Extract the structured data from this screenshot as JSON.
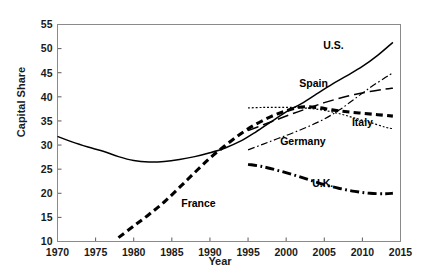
{
  "chart_data": {
    "type": "line",
    "title": "",
    "xlabel": "Year",
    "ylabel": "Capital Share",
    "xlim": [
      1970,
      2015
    ],
    "ylim": [
      10,
      55
    ],
    "xticks": [
      1970,
      1975,
      1980,
      1985,
      1990,
      1995,
      2000,
      2005,
      2010,
      2015
    ],
    "yticks": [
      10,
      15,
      20,
      25,
      30,
      35,
      40,
      45,
      50,
      55
    ],
    "grid": false,
    "legend": "inline-annotations",
    "series": [
      {
        "name": "U.S.",
        "style": "solid",
        "label_x": 2006.2,
        "label_y": 50.0,
        "x": [
          1970,
          1972,
          1974,
          1976,
          1978,
          1980,
          1982,
          1984,
          1986,
          1988,
          1990,
          1992,
          1994,
          1996,
          1998,
          2000,
          2002,
          2004,
          2006,
          2008,
          2010,
          2012,
          2014
        ],
        "y": [
          31.8,
          30.6,
          29.6,
          28.7,
          27.6,
          26.8,
          26.5,
          26.6,
          27.0,
          27.6,
          28.4,
          29.4,
          30.8,
          32.7,
          34.8,
          36.9,
          38.6,
          40.6,
          42.6,
          44.4,
          46.3,
          48.6,
          51.3
        ]
      },
      {
        "name": "France",
        "style": "bold-dashed",
        "label_x": 1988.5,
        "label_y": 17.2,
        "x": [
          1978,
          1980,
          1982,
          1984,
          1986,
          1988,
          1990,
          1992,
          1994,
          1996,
          1998,
          2000,
          2002,
          2004,
          2006,
          2008,
          2010,
          2012,
          2014
        ],
        "y": [
          10.8,
          13.2,
          15.6,
          18.2,
          21.2,
          24.3,
          27.3,
          29.9,
          32.3,
          34.3,
          35.9,
          37.1,
          37.9,
          37.8,
          37.3,
          36.9,
          36.6,
          36.3,
          36.0
        ]
      },
      {
        "name": "Spain",
        "style": "long-dash",
        "label_x": 2003.6,
        "label_y": 42.0,
        "x": [
          1995,
          1997,
          1999,
          2001,
          2003,
          2005,
          2007,
          2009,
          2011,
          2013,
          2014
        ],
        "y": [
          33.0,
          34.2,
          35.4,
          36.6,
          37.7,
          38.8,
          39.7,
          40.5,
          41.1,
          41.6,
          41.8
        ]
      },
      {
        "name": "Italy",
        "style": "fine-dotted",
        "label_x": 2010.0,
        "label_y": 34.0,
        "x": [
          1995,
          1997,
          1999,
          2001,
          2003,
          2005,
          2007,
          2009,
          2011,
          2013,
          2014
        ],
        "y": [
          37.7,
          37.8,
          37.8,
          37.8,
          37.6,
          37.2,
          36.5,
          35.6,
          34.7,
          33.7,
          33.4
        ]
      },
      {
        "name": "Germany",
        "style": "fine-dash-dot",
        "label_x": 2002.2,
        "label_y": 30.1,
        "x": [
          1995,
          1997,
          1999,
          2001,
          2003,
          2005,
          2007,
          2009,
          2011,
          2013,
          2014
        ],
        "y": [
          29.0,
          30.2,
          31.4,
          32.6,
          33.9,
          35.4,
          37.3,
          39.6,
          41.9,
          44.0,
          45.0
        ]
      },
      {
        "name": "U.K.",
        "style": "bold-dash-dot",
        "label_x": 2004.8,
        "label_y": 21.3,
        "x": [
          1995,
          1997,
          1999,
          2001,
          2003,
          2005,
          2007,
          2009,
          2011,
          2013,
          2014
        ],
        "y": [
          26.0,
          25.5,
          24.7,
          23.8,
          22.8,
          21.8,
          21.0,
          20.4,
          20.0,
          19.9,
          20.0
        ]
      }
    ]
  }
}
